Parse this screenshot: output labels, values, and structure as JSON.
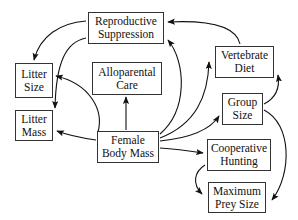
{
  "diagram": {
    "nodes": [
      {
        "id": "reproductive_suppression",
        "line1": "Reproductive",
        "line2": "Suppression"
      },
      {
        "id": "litter_size",
        "line1": "Litter",
        "line2": "Size"
      },
      {
        "id": "alloparental_care",
        "line1": "Alloparental",
        "line2": "Care"
      },
      {
        "id": "litter_mass",
        "line1": "Litter",
        "line2": "Mass"
      },
      {
        "id": "female_body_mass",
        "line1": "Female",
        "line2": "Body Mass"
      },
      {
        "id": "vertebrate_diet",
        "line1": "Vertebrate",
        "line2": "Diet"
      },
      {
        "id": "group_size",
        "line1": "Group",
        "line2": "Size"
      },
      {
        "id": "cooperative_hunting",
        "line1": "Cooperative",
        "line2": "Hunting"
      },
      {
        "id": "maximum_prey_size",
        "line1": "Maximum",
        "line2": "Prey Size"
      }
    ],
    "edges": [
      {
        "from": "reproductive_suppression",
        "to": "litter_size"
      },
      {
        "from": "reproductive_suppression",
        "to": "litter_mass"
      },
      {
        "from": "female_body_mass",
        "to": "litter_size"
      },
      {
        "from": "female_body_mass",
        "to": "litter_mass"
      },
      {
        "from": "female_body_mass",
        "to": "alloparental_care"
      },
      {
        "from": "female_body_mass",
        "to": "reproductive_suppression"
      },
      {
        "from": "female_body_mass",
        "to": "vertebrate_diet"
      },
      {
        "from": "female_body_mass",
        "to": "group_size"
      },
      {
        "from": "female_body_mass",
        "to": "cooperative_hunting"
      },
      {
        "from": "vertebrate_diet",
        "to": "reproductive_suppression"
      },
      {
        "from": "group_size",
        "to": "vertebrate_diet"
      },
      {
        "from": "group_size",
        "to": "maximum_prey_size"
      },
      {
        "from": "cooperative_hunting",
        "to": "maximum_prey_size"
      }
    ],
    "colors": {
      "stroke": "#111111",
      "box_border": "#333333",
      "background": "#ffffff"
    }
  }
}
